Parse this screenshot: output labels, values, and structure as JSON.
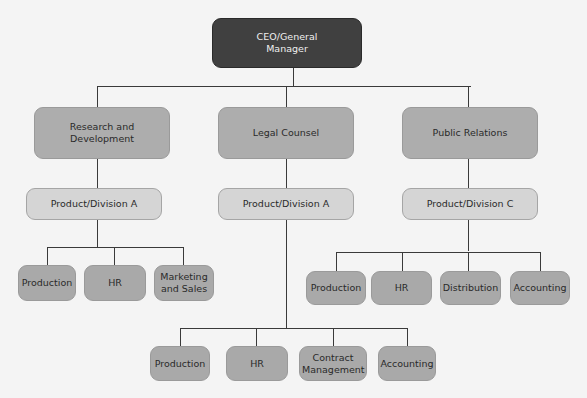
{
  "chart": {
    "root": {
      "label": "CEO/General Manager"
    },
    "departments": [
      {
        "label": "Research and Development",
        "division": "Product/Division A",
        "units": [
          "Production",
          "HR",
          "Marketing and Sales"
        ]
      },
      {
        "label": "Legal Counsel",
        "division": "Product/Division A",
        "units": [
          "Production",
          "HR",
          "Contract Management",
          "Accounting"
        ]
      },
      {
        "label": "Public Relations",
        "division": "Product/Division C",
        "units": [
          "Production",
          "HR",
          "Distribution",
          "Accounting"
        ]
      }
    ]
  },
  "colors": {
    "root_fill": "#404040",
    "dept_fill": "#adadad",
    "division_fill": "#d5d5d5",
    "unit_fill": "#a9a9a9",
    "line": "#3a3a3a",
    "background": "#f4f4f4"
  }
}
